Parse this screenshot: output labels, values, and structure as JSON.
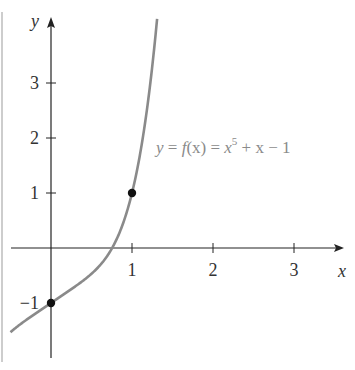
{
  "chart_data": {
    "type": "line",
    "title": "",
    "xlabel": "x",
    "ylabel": "y",
    "xlim": [
      -0.5,
      3.6
    ],
    "ylim": [
      -2.0,
      4.2
    ],
    "grid": false,
    "x_ticks": [
      1,
      2,
      3
    ],
    "x_tick_labels": [
      "1",
      "2",
      "3"
    ],
    "y_ticks": [
      -1,
      1,
      2,
      3
    ],
    "y_tick_labels": [
      "−1",
      "1",
      "2",
      "3"
    ],
    "series": [
      {
        "name": "y = f(x) = x^5 + x − 1",
        "function": "x^5 + x - 1",
        "x_range": [
          -0.5,
          1.31
        ],
        "color": "#8a8a8a"
      }
    ],
    "points": [
      {
        "x": 0,
        "y": -1
      },
      {
        "x": 1,
        "y": 1
      }
    ],
    "annotations": [
      {
        "text": "y = f(x) = x^5 + x − 1",
        "x": 1.3,
        "y": 1.6
      }
    ]
  },
  "labels": {
    "x_axis": "x",
    "y_axis": "y",
    "eq_y": "y",
    "eq_eq1": " = ",
    "eq_f": "f",
    "eq_paren": "(x)",
    "eq_eq2": " = ",
    "eq_x": "x",
    "eq_exp": "5",
    "eq_rest": " + x − 1"
  },
  "colors": {
    "curve": "#8a8a8a",
    "axis": "#222222",
    "point": "#111111",
    "frame": "#bdbdbd"
  }
}
